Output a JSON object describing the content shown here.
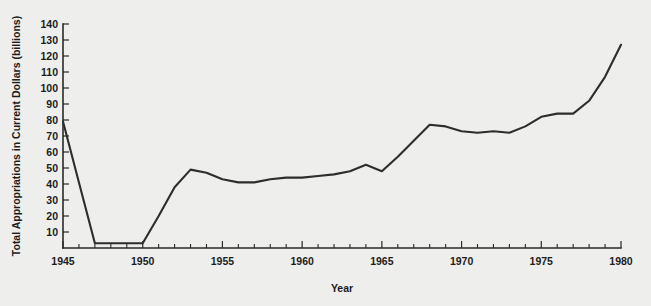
{
  "chart_data": {
    "type": "line",
    "title": "",
    "subtitle": "",
    "xlabel": "Year",
    "ylabel": "Total Appropriations in Current Dollars (billions)",
    "xlim": [
      1945,
      1980
    ],
    "ylim": [
      0,
      140
    ],
    "grid": false,
    "legend": null,
    "x_tick_labels": [
      "1945",
      "1950",
      "1955",
      "1960",
      "1965",
      "1970",
      "1975",
      "1980"
    ],
    "x_major_ticks": [
      1945,
      1950,
      1955,
      1960,
      1965,
      1970,
      1975,
      1980
    ],
    "x_minor_tick_interval": 1,
    "y_tick_labels": [
      "10",
      "20",
      "30",
      "40",
      "50",
      "60",
      "70",
      "80",
      "90",
      "100",
      "110",
      "120",
      "130",
      "140"
    ],
    "y_major_ticks": [
      10,
      20,
      30,
      40,
      50,
      60,
      70,
      80,
      90,
      100,
      110,
      120,
      130,
      140
    ],
    "series": [
      {
        "name": "Total Appropriations",
        "color": "#2d2d2d",
        "x": [
          1945,
          1946,
          1947,
          1948,
          1949,
          1950,
          1951,
          1952,
          1953,
          1954,
          1955,
          1956,
          1957,
          1958,
          1959,
          1960,
          1961,
          1962,
          1963,
          1964,
          1965,
          1966,
          1967,
          1968,
          1969,
          1970,
          1971,
          1972,
          1973,
          1974,
          1975,
          1976,
          1977,
          1978,
          1979,
          1980
        ],
        "values": [
          79,
          41,
          3,
          3,
          3,
          3,
          20,
          38,
          49,
          47,
          43,
          41,
          41,
          43,
          44,
          44,
          45,
          46,
          48,
          52,
          48,
          57,
          67,
          77,
          76,
          73,
          72,
          73,
          72,
          76,
          82,
          84,
          84,
          92,
          107,
          127
        ]
      }
    ]
  },
  "figure": {
    "background_color": "#eeeeec",
    "axis_color": "#2a2a2a"
  }
}
